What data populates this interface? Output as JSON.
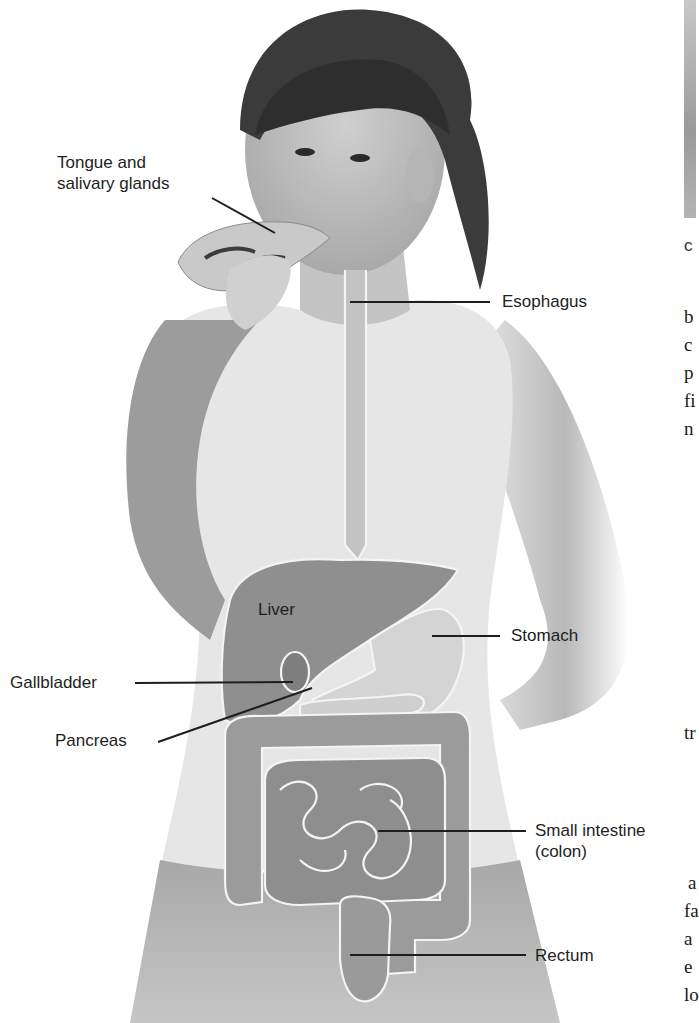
{
  "figure": {
    "labels": {
      "tongue": "Tongue and\nsalivary glands",
      "tongue_line1": "Tongue and",
      "tongue_line2": "salivary glands",
      "esophagus": "Esophagus",
      "liver": "Liver",
      "stomach": "Stomach",
      "gallbladder": "Gallbladder",
      "pancreas": "Pancreas",
      "small_intestine_line1": "Small intestine",
      "small_intestine_line2": "(colon)",
      "rectum": "Rectum"
    },
    "colors": {
      "leader_line": "#1e1e1e",
      "organ_outline": "#f4f4f4",
      "organ_fill_dark": "#8f8f8f",
      "organ_fill_light": "#d6d6d6",
      "skin": "#bdbdbd",
      "hair": "#3a3a3a"
    }
  },
  "right_column": {
    "photo_caption_fragment": "c",
    "text_fragments": [
      {
        "text": "b",
        "top": 306
      },
      {
        "text": "c",
        "top": 334
      },
      {
        "text": "p",
        "top": 362
      },
      {
        "text": "fi",
        "top": 390
      },
      {
        "text": "n",
        "top": 418
      },
      {
        "text": "tr",
        "top": 722
      },
      {
        "text": "a",
        "top": 872
      },
      {
        "text": "fa",
        "top": 900
      },
      {
        "text": "a",
        "top": 928
      },
      {
        "text": "e",
        "top": 956
      },
      {
        "text": "lo",
        "top": 984
      }
    ]
  }
}
